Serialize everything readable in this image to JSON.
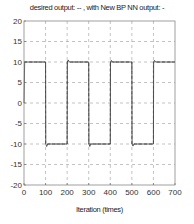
{
  "chart_data": {
    "type": "line",
    "title": "desired output: -- , with New BP NN output: -",
    "xlabel": "Iteration (times)",
    "ylabel": "",
    "xlim": [
      0,
      700
    ],
    "ylim": [
      -20,
      20
    ],
    "xticks": [
      0,
      100,
      200,
      300,
      400,
      500,
      600,
      700
    ],
    "yticks": [
      20,
      15,
      10,
      5,
      0,
      -5,
      -10,
      -15,
      -20
    ],
    "grid": true,
    "legend": "none (described in title)",
    "series": [
      {
        "name": "desired output",
        "style": "dashed",
        "x": [
          0,
          100,
          100,
          200,
          200,
          300,
          300,
          400,
          400,
          500,
          500,
          600,
          600,
          700
        ],
        "values": [
          10,
          10,
          -10,
          -10,
          10,
          10,
          -10,
          -10,
          10,
          10,
          -10,
          -10,
          10,
          10
        ]
      },
      {
        "name": "New BP NN output",
        "style": "solid",
        "x": [
          0,
          3,
          100,
          101,
          105,
          110,
          200,
          201,
          205,
          210,
          300,
          301,
          305,
          310,
          400,
          401,
          405,
          410,
          500,
          501,
          505,
          510,
          600,
          601,
          605,
          610,
          700
        ],
        "values": [
          0,
          10,
          10,
          -10,
          -10.6,
          -10,
          -10,
          10,
          10.5,
          10,
          10,
          -10,
          -10.6,
          -10,
          -10,
          10,
          10.4,
          10,
          10,
          -10,
          -10.5,
          -10,
          -10,
          10,
          10.4,
          10,
          10
        ]
      }
    ]
  },
  "labels": {
    "title": "desired output: -- , with New BP NN output: -",
    "xlabel": "Iteration (times)"
  }
}
